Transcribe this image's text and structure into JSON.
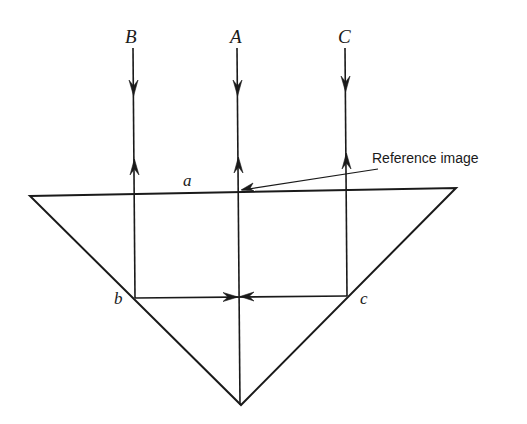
{
  "diagram": {
    "type": "optics-ray-diagram",
    "colors": {
      "line": "#1a1a1a",
      "background": "#ffffff"
    },
    "ray_labels": {
      "B": "B",
      "A": "A",
      "C": "C"
    },
    "point_labels": {
      "a": "a",
      "b": "b",
      "c": "c"
    },
    "annotation": {
      "text": "Reference image"
    },
    "geometry": {
      "prism_vertices": [
        [
          30,
          196
        ],
        [
          456,
          188
        ],
        [
          241,
          405
        ]
      ],
      "rays_x": {
        "B": 134,
        "A": 238,
        "C": 346
      },
      "point_b": [
        135,
        298
      ],
      "point_c": [
        347,
        296
      ]
    }
  }
}
